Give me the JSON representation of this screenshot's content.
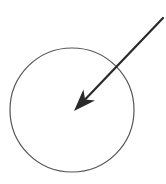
{
  "diagram": {
    "width": 166,
    "height": 184,
    "background": "#ffffff",
    "circle": {
      "cx": 72,
      "cy": 110,
      "r": 62,
      "stroke": "#555555",
      "stroke_width": 1.2,
      "fill": "none"
    },
    "arrow": {
      "tail": {
        "x": 163,
        "y": 18
      },
      "tip": {
        "x": 74,
        "y": 111
      },
      "stroke": "#2a2a2a",
      "stroke_width": 2.2,
      "head_length": 22,
      "head_width": 16,
      "head_notch": 6,
      "direction": "down-left toward circle center"
    }
  }
}
